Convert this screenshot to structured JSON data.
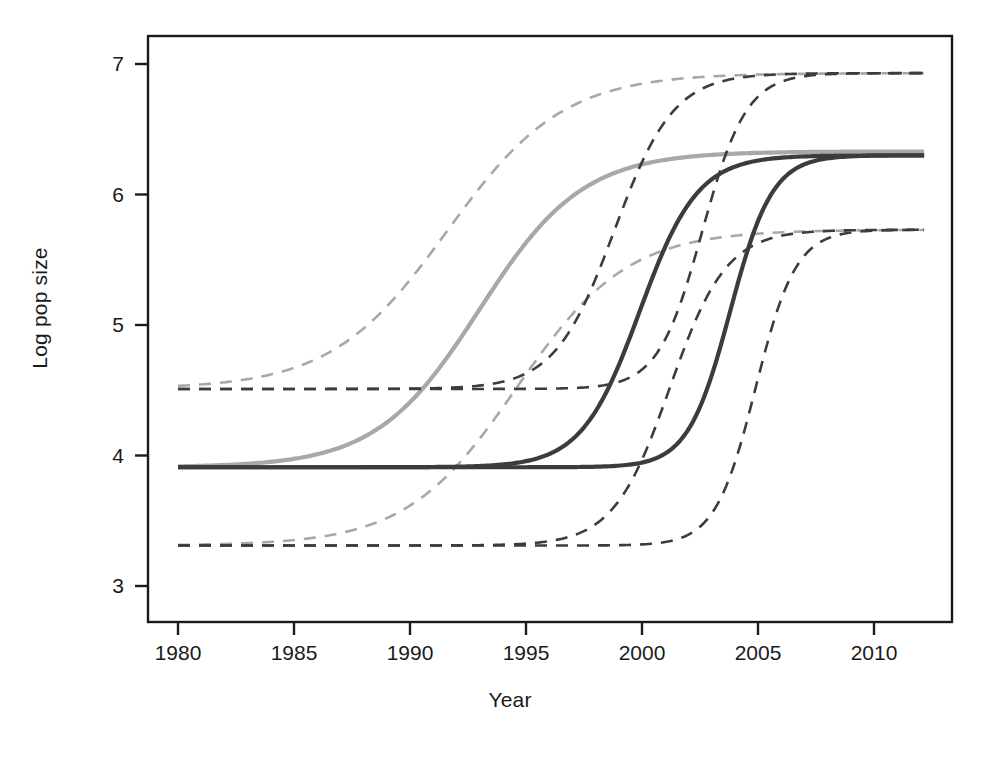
{
  "chart_data": {
    "type": "line",
    "title": "",
    "subtitle": "",
    "xlabel": "Year",
    "ylabel": "Log pop size",
    "xlim": [
      1979.0,
      2012.4
    ],
    "ylim": [
      2.85,
      7.15
    ],
    "xticks": [
      1980,
      1985,
      1990,
      1995,
      2000,
      2005,
      2010
    ],
    "xticklabels": [
      "1980",
      "1985",
      "1990",
      "1995",
      "2000",
      "2010",
      "2010"
    ],
    "xtick_labels": [
      "1980",
      "1985",
      "1990",
      "1995",
      "2000",
      "2005",
      "2010"
    ],
    "yticks": [
      3,
      4,
      5,
      6,
      7
    ],
    "ytick_labels": [
      "3",
      "4",
      "5",
      "6",
      "7"
    ],
    "grid": false,
    "legend": "none",
    "box": true,
    "colors": {
      "series_light": "#a8a8a8",
      "series_dark": "#3c3c3c",
      "axis": "#1a1a1a",
      "background": "#ffffff"
    },
    "series": [
      {
        "name": "Curve 1 mean (light grey, earliest growth)",
        "style": "solid",
        "color": "#a8a8a8",
        "width": 4.2,
        "asymptote_low": 3.91,
        "asymptote_high": 6.33,
        "midpoint_year": 1993.0,
        "rate": 0.45
      },
      {
        "name": "Curve 2 mean (dark grey, mid growth)",
        "style": "solid",
        "color": "#3c3c3c",
        "width": 4.2,
        "asymptote_low": 3.91,
        "asymptote_high": 6.3,
        "midpoint_year": 1999.9,
        "rate": 0.8
      },
      {
        "name": "Curve 3 mean (dark grey, latest growth)",
        "style": "solid",
        "color": "#3c3c3c",
        "width": 4.2,
        "asymptote_low": 3.91,
        "asymptote_high": 6.3,
        "midpoint_year": 2003.8,
        "rate": 1.1
      },
      {
        "name": "Curve 1 upper bound",
        "style": "dashed",
        "color": "#a8a8a8",
        "width": 2.6,
        "asymptote_low": 4.51,
        "asymptote_high": 6.93,
        "midpoint_year": 1991.6,
        "rate": 0.4
      },
      {
        "name": "Curve 1 lower bound",
        "style": "dashed",
        "color": "#a8a8a8",
        "width": 2.6,
        "asymptote_low": 3.31,
        "asymptote_high": 5.73,
        "midpoint_year": 1994.6,
        "rate": 0.42
      },
      {
        "name": "Curve 2 upper bound",
        "style": "dashed",
        "color": "#3c3c3c",
        "width": 2.6,
        "asymptote_low": 4.51,
        "asymptote_high": 6.93,
        "midpoint_year": 1998.8,
        "rate": 0.78
      },
      {
        "name": "Curve 2 lower bound",
        "style": "dashed",
        "color": "#3c3c3c",
        "width": 2.6,
        "asymptote_low": 3.31,
        "asymptote_high": 5.73,
        "midpoint_year": 2001.2,
        "rate": 0.82
      },
      {
        "name": "Curve 3 upper bound",
        "style": "dashed",
        "color": "#3c3c3c",
        "width": 2.6,
        "asymptote_low": 4.51,
        "asymptote_high": 6.93,
        "midpoint_year": 2002.6,
        "rate": 1.05
      },
      {
        "name": "Curve 3 lower bound",
        "style": "dashed",
        "color": "#3c3c3c",
        "width": 2.6,
        "asymptote_low": 3.31,
        "asymptote_high": 5.73,
        "midpoint_year": 2004.9,
        "rate": 1.15
      }
    ],
    "sampled_points": {
      "x": [
        1980,
        1982,
        1984,
        1986,
        1988,
        1990,
        1992,
        1994,
        1996,
        1998,
        2000,
        2002,
        2004,
        2006,
        2008,
        2010,
        2012
      ],
      "curve1_mean": [
        3.91,
        3.93,
        3.98,
        4.09,
        4.31,
        4.7,
        5.25,
        5.77,
        6.09,
        6.23,
        6.29,
        6.32,
        6.33,
        6.33,
        6.33,
        6.33,
        6.33
      ],
      "curve2_mean": [
        3.91,
        3.91,
        3.91,
        3.92,
        3.93,
        3.96,
        4.04,
        4.21,
        4.58,
        5.17,
        5.76,
        6.11,
        6.25,
        6.29,
        6.3,
        6.3,
        6.3
      ],
      "curve3_mean": [
        3.91,
        3.91,
        3.91,
        3.91,
        3.91,
        3.91,
        3.92,
        3.93,
        3.97,
        4.09,
        4.39,
        5.04,
        5.82,
        6.19,
        6.28,
        6.3,
        6.3
      ],
      "curve1_upper": [
        4.51,
        4.55,
        4.65,
        4.83,
        5.15,
        5.62,
        6.13,
        6.52,
        6.75,
        6.86,
        6.9,
        6.92,
        6.93,
        6.93,
        6.93,
        6.93,
        6.93
      ],
      "curve1_lower": [
        3.31,
        3.33,
        3.37,
        3.46,
        3.63,
        3.95,
        4.44,
        5.0,
        5.41,
        5.62,
        5.7,
        5.72,
        5.73,
        5.73,
        5.73,
        5.73,
        5.73
      ],
      "curve2_upper": [
        4.51,
        4.51,
        4.52,
        4.53,
        4.56,
        4.64,
        4.83,
        5.24,
        5.85,
        6.42,
        6.74,
        6.87,
        6.91,
        6.93,
        6.93,
        6.93,
        6.93
      ],
      "curve2_lower": [
        3.31,
        3.31,
        3.31,
        3.32,
        3.33,
        3.35,
        3.41,
        3.55,
        3.9,
        4.5,
        5.15,
        5.55,
        5.69,
        5.72,
        5.73,
        5.73,
        5.73
      ],
      "curve3_upper": [
        4.51,
        4.51,
        4.51,
        4.51,
        4.52,
        4.53,
        4.57,
        4.7,
        5.03,
        5.67,
        6.36,
        6.77,
        6.89,
        6.92,
        6.93,
        6.93,
        6.93
      ],
      "curve3_lower": [
        3.31,
        3.31,
        3.31,
        3.31,
        3.31,
        3.31,
        3.32,
        3.33,
        3.36,
        3.47,
        3.78,
        4.43,
        5.2,
        5.59,
        5.7,
        5.73,
        5.73
      ]
    }
  }
}
